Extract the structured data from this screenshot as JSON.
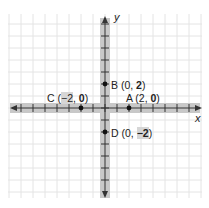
{
  "diagram": {
    "type": "coordinate-plane",
    "unit_px": 12,
    "origin_px": [
      105,
      108
    ],
    "grid": {
      "x_min": -8,
      "x_max": 8,
      "y_min": -7,
      "y_max": 7
    },
    "colors": {
      "grid": "#e4e4e4",
      "axis_band": "#c8c8c8",
      "axis_line": "#333333",
      "point": "#111111",
      "text": "#222222"
    },
    "axes": {
      "x_label": "x",
      "y_label": "y"
    },
    "points": [
      {
        "id": "A",
        "name": "A",
        "x": 2,
        "y": 0,
        "prefix": "A (2, ",
        "bold": "0",
        "suffix": ")"
      },
      {
        "id": "B",
        "name": "B",
        "x": 0,
        "y": 2,
        "prefix": "B (0, ",
        "bold": "2",
        "suffix": ")"
      },
      {
        "id": "C",
        "name": "C",
        "x": -2,
        "y": 0,
        "prefix": "C (",
        "bold_pre": "−2",
        "mid": ", ",
        "bold": "0",
        "suffix": ")"
      },
      {
        "id": "D",
        "name": "D",
        "x": 0,
        "y": -2,
        "prefix": "D (0, ",
        "bold": "−2",
        "suffix": ")"
      }
    ]
  }
}
